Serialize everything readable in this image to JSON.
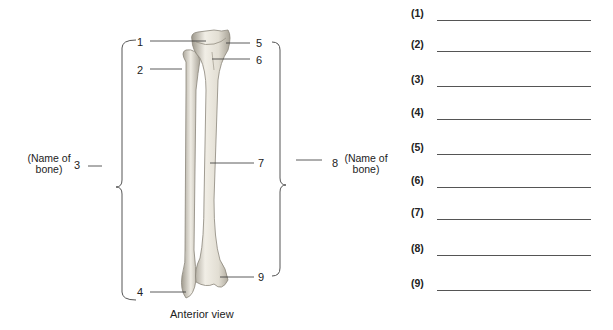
{
  "figure": {
    "caption": "Anterior view",
    "labels": [
      {
        "id": "1",
        "text": "1"
      },
      {
        "id": "2",
        "text": "2"
      },
      {
        "id": "3",
        "text": "3"
      },
      {
        "id": "4",
        "text": "4"
      },
      {
        "id": "5",
        "text": "5"
      },
      {
        "id": "6",
        "text": "6"
      },
      {
        "id": "7",
        "text": "7"
      },
      {
        "id": "8",
        "text": "8"
      },
      {
        "id": "9",
        "text": "9"
      }
    ],
    "bone_name_left": {
      "line1": "(Name of",
      "line2": "bone)"
    },
    "bone_name_right": {
      "line1": "(Name of",
      "line2": "bone)"
    },
    "colors": {
      "bone_fill": "#ece9e0",
      "bone_shade": "#b9b4a8",
      "leader": "#333333",
      "bracket": "#555555"
    }
  },
  "answers": [
    {
      "label": "(1)",
      "value": ""
    },
    {
      "label": "(2)",
      "value": ""
    },
    {
      "label": "(3)",
      "value": ""
    },
    {
      "label": "(4)",
      "value": ""
    },
    {
      "label": "(5)",
      "value": ""
    },
    {
      "label": "(6)",
      "value": ""
    },
    {
      "label": "(7)",
      "value": ""
    },
    {
      "label": "(8)",
      "value": ""
    },
    {
      "label": "(9)",
      "value": ""
    }
  ]
}
